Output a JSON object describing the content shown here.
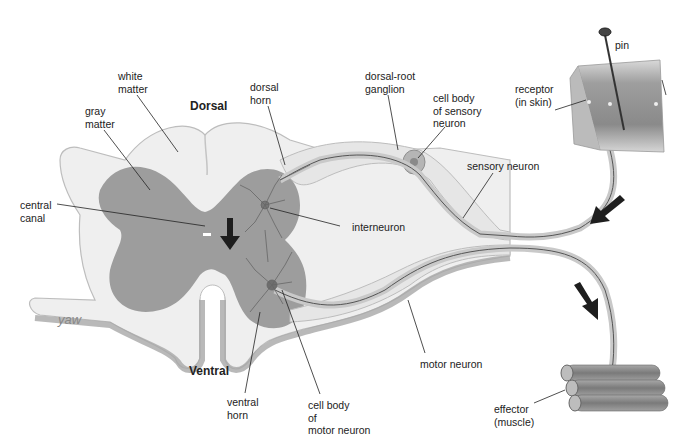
{
  "diagram": {
    "type": "reflex-arc",
    "orientation_labels": {
      "dorsal": "Dorsal",
      "ventral": "Ventral"
    },
    "labels": {
      "white_matter": "white\nmatter",
      "gray_matter": "gray\nmatter",
      "central_canal": "central\ncanal",
      "dorsal_horn": "dorsal\nhorn",
      "dorsal_root_ganglion": "dorsal-root\nganglion",
      "cell_body_sensory": "cell body\nof sensory\nneuron",
      "pin": "pin",
      "receptor": "receptor\n(in skin)",
      "sensory_neuron": "sensory neuron",
      "interneuron": "interneuron",
      "motor_neuron": "motor neuron",
      "ventral_horn": "ventral\nhorn",
      "cell_body_motor": "cell body\nof\nmotor neuron",
      "effector": "effector\n(muscle)"
    },
    "signature": "yaw",
    "colors": {
      "white_matter": "#ececec",
      "gray_matter": "#9a9a9a",
      "outline": "#bdbdbd",
      "nerve": "#d8d8d8",
      "arrow": "#1e1e1e",
      "skin": "#b0b0b0",
      "muscle": "#8c8c8c"
    }
  }
}
